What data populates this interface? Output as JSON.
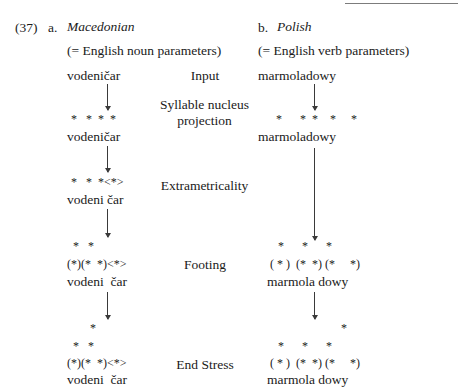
{
  "document": {
    "example_number": "(37)",
    "top_rule": true
  },
  "columns": {
    "a": {
      "marker": "a.",
      "language": "Macedonian",
      "gloss": "(= English noun parameters)",
      "rows": [
        {
          "stage": "input",
          "grid": [],
          "word": "vodeničar"
        },
        {
          "stage": "syllable-nucleus",
          "grid": [
            "*  *  *  *"
          ],
          "word": "vodeničar"
        },
        {
          "stage": "extrametricality",
          "grid": [
            "*   *  *<*>"
          ],
          "word": "vodeni čar"
        },
        {
          "stage": "footing",
          "grid": [
            " *   *",
            "(*)(*  *)<*>"
          ],
          "word": "vodeni  čar"
        },
        {
          "stage": "end-stress",
          "grid": [
            "    *",
            " *   *",
            "(*)(*  *)<*>"
          ],
          "word": "vodeni  čar"
        }
      ]
    },
    "b": {
      "marker": "b.",
      "language": "Polish",
      "gloss": "(= English verb parameters)",
      "rows": [
        {
          "stage": "input",
          "grid": [],
          "word": "marmoladowy"
        },
        {
          "stage": "syllable-nucleus",
          "grid": [
            "*    * *   *    *"
          ],
          "word": "marmoladowy"
        },
        {
          "stage": "extrametricality",
          "grid": [],
          "word": ""
        },
        {
          "stage": "footing",
          "grid": [
            " *     *     *"
          ],
          "word": "marmola dowy",
          "feet": "( * ) (* *) (*    *)"
        },
        {
          "stage": "end-stress",
          "grid": [
            "             *",
            " *     *     *"
          ],
          "word": "marmola dowy",
          "feet": "( * ) (* *) (*    *)"
        }
      ]
    }
  },
  "stage_labels": [
    {
      "id": "input",
      "text": "Input"
    },
    {
      "id": "syllable-nucleus",
      "line1": "Syllable nucleus",
      "line2": "projection"
    },
    {
      "id": "extrametricality",
      "text": "Extrametricality"
    },
    {
      "id": "footing",
      "text": "Footing"
    },
    {
      "id": "end-stress",
      "text": "End Stress"
    }
  ],
  "grid_cells": {
    "a_syl": "*   *  *  *",
    "a_extra": "*   *  *<*>",
    "a_foot_top": "*   *",
    "a_foot": "(*)(*  *)<*>",
    "a_end_top1": "*",
    "a_end_top2": "*   *",
    "a_end": "(*)(*  *)<*>",
    "b_syl": "*      *  *    *     *",
    "b_foot_top": "*      *      *",
    "b_foot": "( * )  (*  *) (*     *)",
    "b_end_top1": "*",
    "b_end_top2": "*      *      *",
    "b_end": "( * )  (*  *) (*     *)"
  },
  "words": {
    "a_input": "vodeničar",
    "a_syl": "vodeničar",
    "a_extra": "vodeni čar",
    "a_foot": "vodeni  čar",
    "a_end": "vodeni  čar",
    "b_input": "marmoladowy",
    "b_syl": "marmoladowy",
    "b_foot": "marmola dowy",
    "b_end": "marmola dowy"
  }
}
